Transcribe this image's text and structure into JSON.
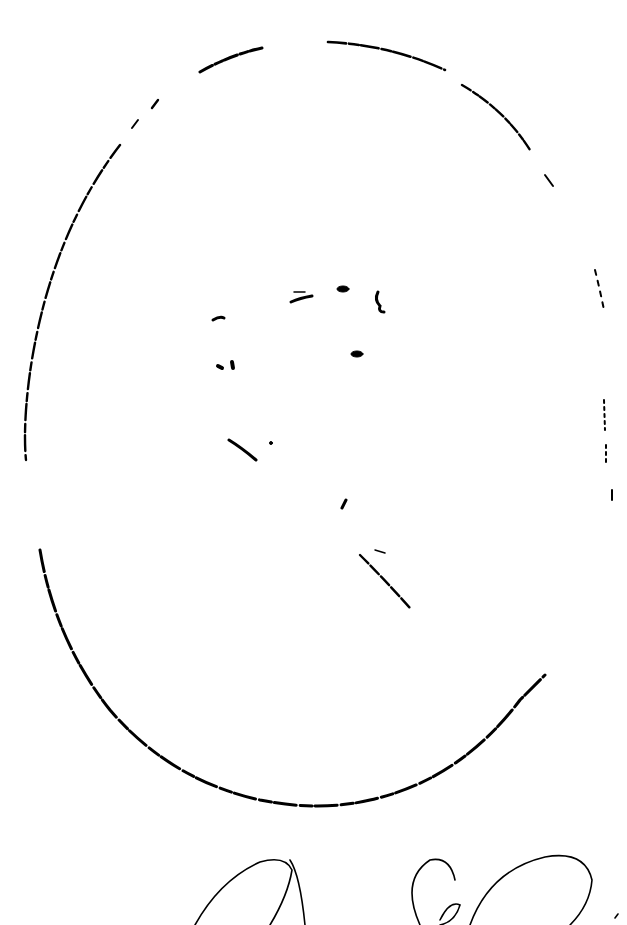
{
  "image": {
    "description": "Faded oval portrait engraving with a handwritten signature below",
    "frame": {
      "shape": "oval",
      "stroke_color": "#000000",
      "background": "#ffffff"
    },
    "signature": {
      "style": "cursive",
      "color": "#000000"
    }
  }
}
